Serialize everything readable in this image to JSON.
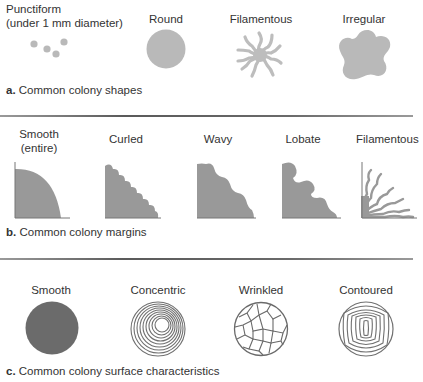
{
  "colors": {
    "light_fill": "#b9b9b9",
    "medium_fill": "#9a9a9a",
    "dark_fill": "#6b6b6b",
    "line": "#6a6a6a",
    "divider": "#5a5a5a"
  },
  "sections": [
    {
      "letter": "a.",
      "caption": "Common colony shapes",
      "items": [
        {
          "label": "Punctiform",
          "sublabel": "(under 1 mm diameter)",
          "icon": "punctiform-dots-icon"
        },
        {
          "label": "Round",
          "icon": "round-colony-icon"
        },
        {
          "label": "Filamentous",
          "icon": "filamentous-colony-icon"
        },
        {
          "label": "Irregular",
          "icon": "irregular-colony-icon"
        }
      ]
    },
    {
      "letter": "b.",
      "caption": "Common colony margins",
      "items": [
        {
          "label": "Smooth",
          "sublabel": "(entire)",
          "icon": "smooth-margin-icon"
        },
        {
          "label": "Curled",
          "icon": "curled-margin-icon"
        },
        {
          "label": "Wavy",
          "icon": "wavy-margin-icon"
        },
        {
          "label": "Lobate",
          "icon": "lobate-margin-icon"
        },
        {
          "label": "Filamentous",
          "icon": "filamentous-margin-icon"
        }
      ]
    },
    {
      "letter": "c.",
      "caption": "Common colony surface characteristics",
      "items": [
        {
          "label": "Smooth",
          "icon": "smooth-surface-icon"
        },
        {
          "label": "Concentric",
          "icon": "concentric-surface-icon"
        },
        {
          "label": "Wrinkled",
          "icon": "wrinkled-surface-icon"
        },
        {
          "label": "Contoured",
          "icon": "contoured-surface-icon"
        }
      ]
    }
  ]
}
